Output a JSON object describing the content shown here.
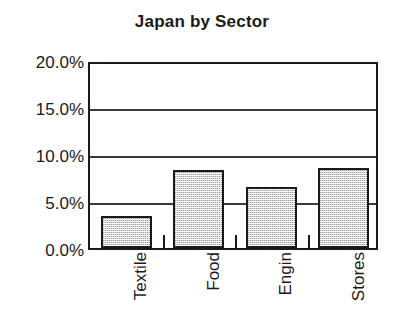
{
  "chart_data": {
    "type": "bar",
    "title": "Japan by Sector",
    "xlabel": "",
    "ylabel": "",
    "categories": [
      "Textile",
      "Food",
      "Engin",
      "Stores"
    ],
    "values": [
      3.4,
      8.3,
      6.5,
      8.5
    ],
    "value_labels": [
      "3.4%",
      "8.3%",
      "6.5%",
      "8.5%"
    ],
    "ylim": [
      0,
      20
    ],
    "ytick_values": [
      0,
      5,
      10,
      15,
      20
    ],
    "ytick_labels": [
      "0.0%",
      "5.0%",
      "10.0%",
      "15.0%",
      "20.0%"
    ],
    "grid": true,
    "grid_axis": "y",
    "legend": false,
    "legend_position": "none",
    "units": "percent",
    "bar_fill": "#d4d4d4",
    "bar_edge": "#1a1a1a",
    "axis_color": "#1a1a1a",
    "background": "#ffffff",
    "series": [
      {
        "name": "Japan by Sector",
        "values": [
          3.4,
          8.3,
          6.5,
          8.5
        ]
      }
    ]
  }
}
